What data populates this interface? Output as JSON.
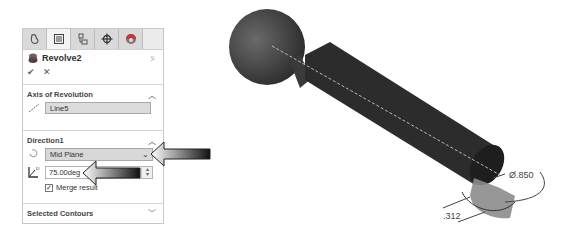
{
  "property_manager": {
    "tabs": [
      {
        "name": "feature-manager-tab",
        "icon": "feature-tree-icon",
        "active": false
      },
      {
        "name": "property-manager-tab",
        "icon": "property-list-icon",
        "active": true
      },
      {
        "name": "configuration-manager-tab",
        "icon": "configuration-icon",
        "active": false
      },
      {
        "name": "dimxpert-manager-tab",
        "icon": "crosshair-icon",
        "active": false
      },
      {
        "name": "display-manager-tab",
        "icon": "appearance-sphere-icon",
        "active": false
      }
    ],
    "feature_title": "Revolve2",
    "help_icon": "pushpin-icon",
    "ok_label": "✔",
    "cancel_label": "✕",
    "sections": {
      "axis": {
        "title": "Axis of Revolution",
        "value": "Line5",
        "collapsed": false
      },
      "direction1": {
        "title": "Direction1",
        "end_condition": "Mid Plane",
        "angle": "75.00deg",
        "merge_result_label": "Merge result",
        "merge_result_checked": true,
        "collapsed": false
      },
      "selected_contours": {
        "title": "Selected Contours",
        "collapsed": true
      }
    }
  },
  "viewport": {
    "dimension_diameter": "Ø.850",
    "dimension_offset": ".312"
  },
  "colors": {
    "tab_bg": "#d9d9d9",
    "field_bg": "#dcdcdc",
    "model_dark": "#3a3a3a",
    "preview_gray": "#8c8c8c"
  }
}
